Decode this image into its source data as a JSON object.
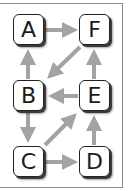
{
  "diagram": {
    "type": "directed-graph",
    "colors": {
      "edge": "#a3a3a3",
      "node_border": "#222222",
      "frame": "#8a8a8a"
    },
    "nodes": [
      {
        "id": "A",
        "label": "A",
        "x": 13,
        "y": 14
      },
      {
        "id": "F",
        "label": "F",
        "x": 79,
        "y": 14
      },
      {
        "id": "B",
        "label": "B",
        "x": 13,
        "y": 80
      },
      {
        "id": "E",
        "label": "E",
        "x": 79,
        "y": 80
      },
      {
        "id": "C",
        "label": "C",
        "x": 13,
        "y": 146
      },
      {
        "id": "D",
        "label": "D",
        "x": 79,
        "y": 146
      }
    ],
    "edges": [
      {
        "from": "A",
        "to": "F"
      },
      {
        "from": "F",
        "to": "B"
      },
      {
        "from": "B",
        "to": "A"
      },
      {
        "from": "E",
        "to": "B"
      },
      {
        "from": "E",
        "to": "F"
      },
      {
        "from": "B",
        "to": "C"
      },
      {
        "from": "C",
        "to": "E"
      },
      {
        "from": "C",
        "to": "D"
      },
      {
        "from": "D",
        "to": "E"
      }
    ]
  }
}
